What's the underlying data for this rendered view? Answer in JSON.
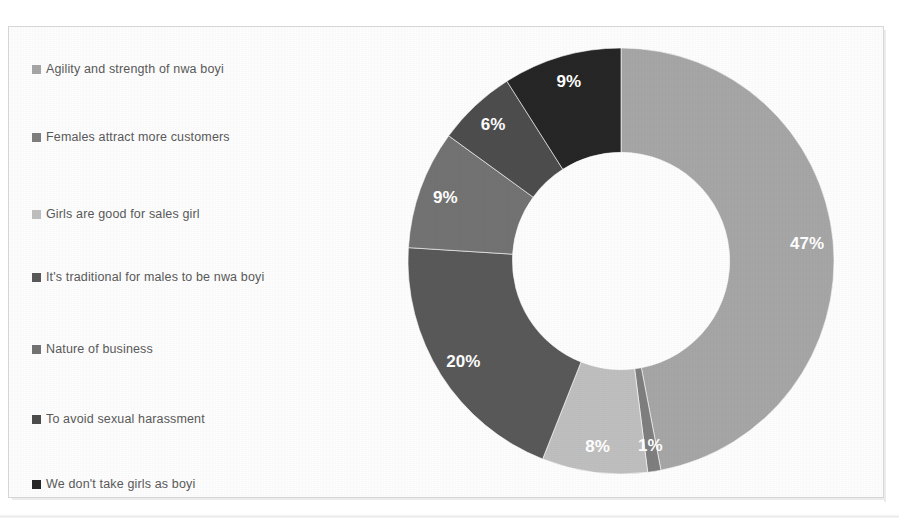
{
  "figure": {
    "background_color": "#fdfdfd",
    "border_color": "#d8d8d8"
  },
  "legend": {
    "position": "left",
    "marker_icon": "square-marker-icon",
    "items": [
      {
        "label": "Agility and strength of nwa boyi",
        "color": "#a6a6a6",
        "top": 10
      },
      {
        "label": "Females attract more customers",
        "color": "#7f7f7f",
        "top": 78
      },
      {
        "label": "Girls are good for sales girl",
        "color": "#bfbfbf",
        "top": 155
      },
      {
        "label": "It's traditional for males to be nwa boyi",
        "color": "#595959",
        "top": 218
      },
      {
        "label": "Nature of business",
        "color": "#737373",
        "top": 290
      },
      {
        "label": "To avoid sexual harassment",
        "color": "#4d4d4d",
        "top": 360
      },
      {
        "label": "We don't take girls as boyi",
        "color": "#262626",
        "top": 425
      }
    ]
  },
  "chart_data": {
    "type": "pie",
    "variant": "doughnut",
    "title": "",
    "hole_ratio": 0.51,
    "start_angle_deg": 0,
    "direction": "clockwise",
    "label_format": "percent",
    "label_color": "#ffffff",
    "categories": [
      "Agility and strength of nwa boyi",
      "Females attract more customers",
      "Girls are good for sales girl",
      "It's traditional for males to be nwa boyi",
      "Nature of business",
      "To avoid sexual harassment",
      "We don't take girls as boyi"
    ],
    "values": [
      47,
      1,
      8,
      20,
      9,
      6,
      9
    ],
    "labels": [
      "47%",
      "1%",
      "8%",
      "20%",
      "9%",
      "6%",
      "9%"
    ],
    "colors": [
      "#a6a6a6",
      "#7f7f7f",
      "#bfbfbf",
      "#595959",
      "#737373",
      "#4d4d4d",
      "#262626"
    ],
    "total": 100,
    "xlabel": "",
    "ylabel": "",
    "legend_position": "left",
    "grid": false
  }
}
